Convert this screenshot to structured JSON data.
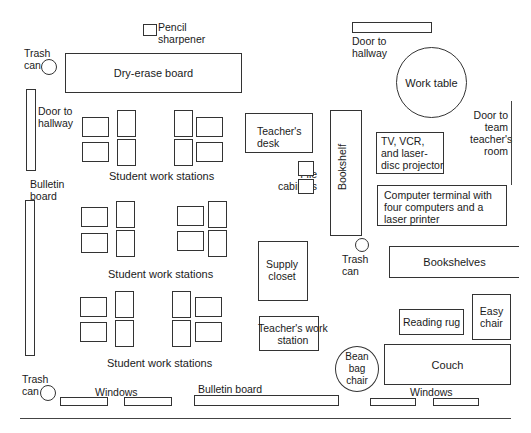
{
  "floor_plan": {
    "title": "Classroom floor plan",
    "labels": {
      "pencil_sharpener": "Pencil\nsharpener",
      "trash_can_top_left": "Trash\ncan",
      "dry_erase_board": "Dry-erase board",
      "door_to_hallway_left": "Door to\nhallway",
      "door_to_hallway_top": "Door to\nhallway",
      "work_table": "Work table",
      "door_to_team_room": "Door to\nteam\nteacher's\nroom",
      "teachers_desk": "Teacher's\ndesk",
      "file_cabinets": "File\ncabinets",
      "bookshelf": "Bookshelf",
      "tv_vcr": "TV, VCR,\nand laser-\ndisc projector",
      "computer_terminal": "Computer terminal with\nfour computers and a\nlaser printer",
      "bulletin_board_left": "Bulletin\nboard",
      "student_stations_1": "Student work stations",
      "student_stations_2": "Student work stations",
      "student_stations_3": "Student work stations",
      "supply_closet": "Supply\ncloset",
      "trash_can_middle": "Trash\ncan",
      "bookshelves": "Bookshelves",
      "teachers_work_station": "Teacher's work\nstation",
      "reading_rug": "Reading rug",
      "easy_chair": "Easy\nchair",
      "bean_bag_chair": "Bean\nbag\nchair",
      "couch": "Couch",
      "trash_can_bottom_left": "Trash\ncan",
      "windows_left": "Windows",
      "bulletin_board_bottom": "Bulletin board",
      "windows_right": "Windows"
    }
  }
}
